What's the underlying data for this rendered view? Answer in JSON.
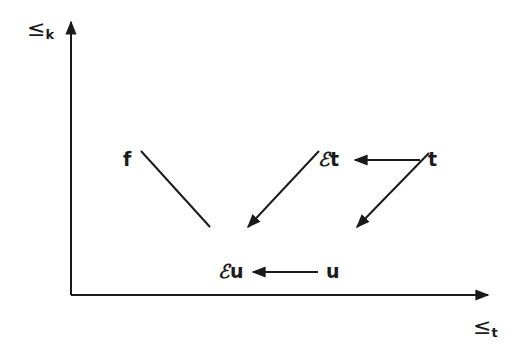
{
  "diagram": {
    "axes": {
      "y": {
        "symbol": "≤",
        "subscript": "k"
      },
      "x": {
        "symbol": "≤",
        "subscript": "t"
      }
    },
    "nodes": {
      "f": {
        "label": "f"
      },
      "Et": {
        "prefix": "ℰ",
        "label": "t"
      },
      "t": {
        "label": "t"
      },
      "Eu": {
        "prefix": "ℰ",
        "label": "u"
      },
      "u": {
        "label": "u"
      }
    },
    "edges": [
      {
        "from": "f",
        "to": "Eu",
        "arrow": false
      },
      {
        "from": "Et",
        "to": "Eu",
        "arrow": true
      },
      {
        "from": "t",
        "to": "Et",
        "arrow": true
      },
      {
        "from": "t",
        "to": "u",
        "arrow": true
      },
      {
        "from": "u",
        "to": "Eu",
        "arrow": true
      }
    ],
    "colors": {
      "ink": "#1a1a1a",
      "background": "#ffffff"
    }
  }
}
